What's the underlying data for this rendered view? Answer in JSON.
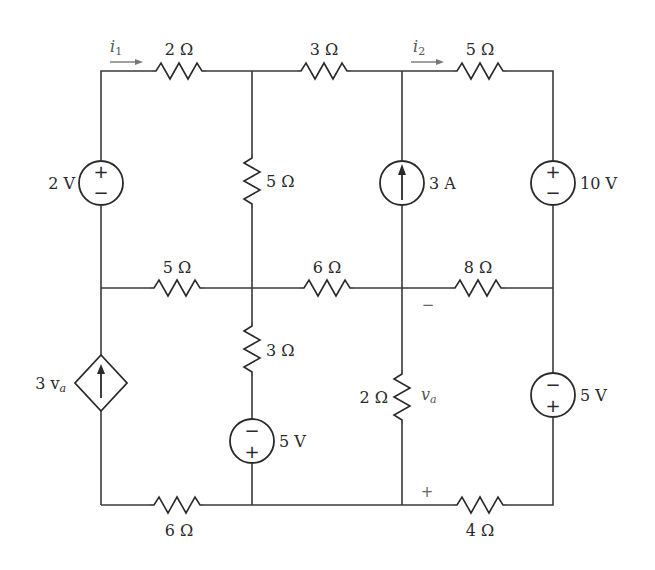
{
  "diagram": {
    "type": "circuit",
    "nodes": {
      "columns_x": [
        101,
        252,
        402,
        553
      ],
      "rows_y": [
        71,
        288,
        505
      ]
    },
    "labels": {
      "i1": "i",
      "i1_sub": "1",
      "i2": "i",
      "i2_sub": "2",
      "r_top_left": "2 Ω",
      "r_top_mid": "3 Ω",
      "r_top_right": "5 Ω",
      "r_vert_col2_top": "5 Ω",
      "r_mid_left": "5 Ω",
      "r_mid_mid": "6 Ω",
      "r_mid_right": "8 Ω",
      "r_vert_col2_bottom": "3 Ω",
      "r_vert_col3_bottom": "2 Ω",
      "r_bot_left": "6 Ω",
      "r_bot_right": "4 Ω",
      "v_source_left": "2 V",
      "i_source_mid": "3 A",
      "v_source_right_top": "10 V",
      "v_source_col2_bottom": "5 V",
      "v_source_right_bottom": "5 V",
      "dep_source": "3 v",
      "dep_source_sub": "a",
      "va": "v",
      "va_sub": "a",
      "va_minus": "−",
      "va_plus": "+"
    },
    "components": [
      {
        "id": "R1",
        "type": "resistor",
        "value": "2 Ω",
        "location": "top branch, left"
      },
      {
        "id": "R2",
        "type": "resistor",
        "value": "3 Ω",
        "location": "top branch, middle"
      },
      {
        "id": "R3",
        "type": "resistor",
        "value": "5 Ω",
        "location": "top branch, right"
      },
      {
        "id": "R4",
        "type": "resistor",
        "value": "5 Ω",
        "location": "column 2, upper"
      },
      {
        "id": "R5",
        "type": "resistor",
        "value": "5 Ω",
        "location": "middle row, left"
      },
      {
        "id": "R6",
        "type": "resistor",
        "value": "6 Ω",
        "location": "middle row, middle"
      },
      {
        "id": "R7",
        "type": "resistor",
        "value": "8 Ω",
        "location": "middle row, right"
      },
      {
        "id": "R8",
        "type": "resistor",
        "value": "3 Ω",
        "location": "column 2, lower"
      },
      {
        "id": "R9",
        "type": "resistor",
        "value": "2 Ω",
        "location": "column 3, lower"
      },
      {
        "id": "R10",
        "type": "resistor",
        "value": "6 Ω",
        "location": "bottom row, left"
      },
      {
        "id": "R11",
        "type": "resistor",
        "value": "4 Ω",
        "location": "bottom row, right"
      },
      {
        "id": "V1",
        "type": "voltage_source",
        "value": "2 V",
        "polarity": "+ top"
      },
      {
        "id": "I1",
        "type": "current_source",
        "value": "3 A",
        "direction": "up"
      },
      {
        "id": "V2",
        "type": "voltage_source",
        "value": "10 V",
        "polarity": "+ top"
      },
      {
        "id": "V3",
        "type": "voltage_source",
        "value": "5 V",
        "polarity": "− top",
        "location": "column 2 lower"
      },
      {
        "id": "V4",
        "type": "voltage_source",
        "value": "5 V",
        "polarity": "− top",
        "location": "right column lower"
      },
      {
        "id": "D1",
        "type": "dependent_current_source",
        "value": "3 v_a",
        "direction": "up"
      }
    ]
  }
}
